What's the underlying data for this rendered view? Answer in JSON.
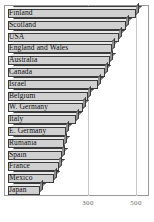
{
  "chart_data": {
    "type": "bar",
    "orientation": "horizontal",
    "title": "",
    "xlabel": "",
    "ylabel": "",
    "xlim": [
      0,
      560
    ],
    "xticks": [
      300,
      500
    ],
    "xtick_labels": [
      "300",
      "500"
    ],
    "grid": true,
    "legend": null,
    "categories": [
      "Finland",
      "Scotland",
      "USA",
      "England and Wales",
      "Australia",
      "Canada",
      "Israel",
      "Belgium",
      "W. Germany",
      "Italy",
      "E. Germany",
      "Rumania",
      "Spain",
      "France",
      "Mexico",
      "Japan"
    ],
    "values": [
      500,
      460,
      430,
      400,
      390,
      370,
      340,
      300,
      280,
      250,
      210,
      200,
      190,
      180,
      160,
      100
    ]
  },
  "colors": {
    "bar_face": "#d0d0d0",
    "bar_top": "#e8e8e8",
    "bar_side": "#8f8f8f",
    "bar_outline": "#3a3a3a",
    "grid": "#c9c9c9",
    "frame": "#9a9a9a",
    "text": "#111111",
    "tick_text": "#6b6b6b",
    "background": "#ffffff"
  }
}
